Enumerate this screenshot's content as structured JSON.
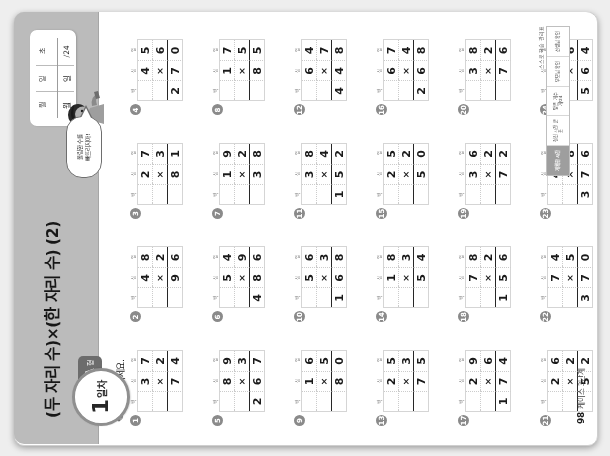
{
  "document": {
    "title": "(두 자리 수)×(한 자리 수) (2)",
    "instruction": "곱셈을 하세요.",
    "pencil_icon": "pencil-icon",
    "page_number": "98",
    "footer_note": "케이스 3단계"
  },
  "badge": {
    "day_number": "1",
    "day_label": "일차",
    "set_letter": "A",
    "set_suffix": "형"
  },
  "datebox": {
    "labels": [
      "월",
      "일",
      "초"
    ],
    "values": [
      "월",
      "일",
      "/24"
    ]
  },
  "mascot": {
    "bubble_line1": "올림한 수를",
    "bubble_line2": "빠뜨리지마!",
    "icon": "mascot-character"
  },
  "column_headers": [
    "백",
    "십",
    "일"
  ],
  "operator": "×",
  "problems": [
    {
      "n": "1",
      "a": "37",
      "b": "2",
      "answer": "74"
    },
    {
      "n": "2",
      "a": "48",
      "b": "2",
      "answer": "96"
    },
    {
      "n": "3",
      "a": "27",
      "b": "3",
      "answer": "81"
    },
    {
      "n": "4",
      "a": "45",
      "b": "6",
      "answer": "270"
    },
    {
      "n": "5",
      "a": "89",
      "b": "3",
      "answer": "267"
    },
    {
      "n": "6",
      "a": "54",
      "b": "9",
      "answer": "486"
    },
    {
      "n": "7",
      "a": "19",
      "b": "2",
      "answer": "38"
    },
    {
      "n": "8",
      "a": "17",
      "b": "5",
      "answer": "85"
    },
    {
      "n": "9",
      "a": "16",
      "b": "5",
      "answer": "80"
    },
    {
      "n": "10",
      "a": "56",
      "b": "3",
      "answer": "168"
    },
    {
      "n": "11",
      "a": "38",
      "b": "4",
      "answer": "152"
    },
    {
      "n": "12",
      "a": "64",
      "b": "7",
      "answer": "448"
    },
    {
      "n": "13",
      "a": "25",
      "b": "3",
      "answer": "75"
    },
    {
      "n": "14",
      "a": "18",
      "b": "3",
      "answer": "54"
    },
    {
      "n": "15",
      "a": "25",
      "b": "2",
      "answer": "50"
    },
    {
      "n": "16",
      "a": "67",
      "b": "4",
      "answer": "268"
    },
    {
      "n": "17",
      "a": "29",
      "b": "6",
      "answer": "174"
    },
    {
      "n": "18",
      "a": "78",
      "b": "2",
      "answer": "156"
    },
    {
      "n": "19",
      "a": "36",
      "b": "2",
      "answer": "72"
    },
    {
      "n": "20",
      "a": "38",
      "b": "2",
      "answer": "76"
    },
    {
      "n": "21",
      "a": "26",
      "b": "2",
      "answer": "52"
    },
    {
      "n": "22",
      "a": "74",
      "b": "5",
      "answer": "370"
    },
    {
      "n": "23",
      "a": "47",
      "b": "8",
      "answer": "376"
    },
    {
      "n": "24",
      "a": "94",
      "b": "6",
      "answer": "564"
    }
  ],
  "reference_strip": {
    "title": "스스로 학습 관리표",
    "cells": [
      "계획한 시간",
      "걸린 시간\n분 초",
      "맞은 개수\n개/24",
      "부모님 확인",
      "선생님 확인"
    ]
  },
  "colors": {
    "header_band": "#b9b9b9",
    "badge_border": "#8e8e8e",
    "tab": "#6d6d6d",
    "page_bg": "#eeeeee",
    "ink": "#1e1e1e"
  }
}
